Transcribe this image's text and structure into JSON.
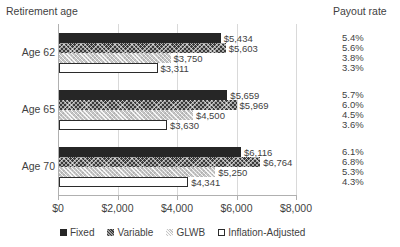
{
  "header": {
    "left_title": "Retirement age",
    "right_title": "Payout rate"
  },
  "chart_data": {
    "type": "bar",
    "orientation": "horizontal",
    "title": "",
    "xlabel": "",
    "ylabel": "",
    "xlim": [
      0,
      8000
    ],
    "xticks": [
      0,
      2000,
      4000,
      6000,
      8000
    ],
    "xtick_labels": [
      "$0",
      "$2,000",
      "$4,000",
      "$6,000",
      "$8,000"
    ],
    "grid": true,
    "legend_position": "bottom",
    "categories": [
      "Age 62",
      "Age 65",
      "Age 70"
    ],
    "series": [
      {
        "name": "Fixed",
        "values": [
          5434,
          5659,
          6116
        ],
        "labels": [
          "$5,434",
          "$5,659",
          "$6,116"
        ]
      },
      {
        "name": "Variable",
        "values": [
          5603,
          5969,
          6764
        ],
        "labels": [
          "$5,603",
          "$5,969",
          "$6,764"
        ]
      },
      {
        "name": "GLWB",
        "values": [
          3750,
          4500,
          5250
        ],
        "labels": [
          "$3,750",
          "$4,500",
          "$5,250"
        ]
      },
      {
        "name": "Inflation-Adjusted",
        "values": [
          3311,
          3630,
          4341
        ],
        "labels": [
          "$3,311",
          "$3,630",
          "$4,341"
        ]
      }
    ],
    "payout_rates": [
      [
        "5.4%",
        "5.6%",
        "3.8%",
        "3.3%"
      ],
      [
        "5.7%",
        "6.0%",
        "4.5%",
        "3.6%"
      ],
      [
        "6.1%",
        "6.8%",
        "5.3%",
        "4.3%"
      ]
    ]
  }
}
